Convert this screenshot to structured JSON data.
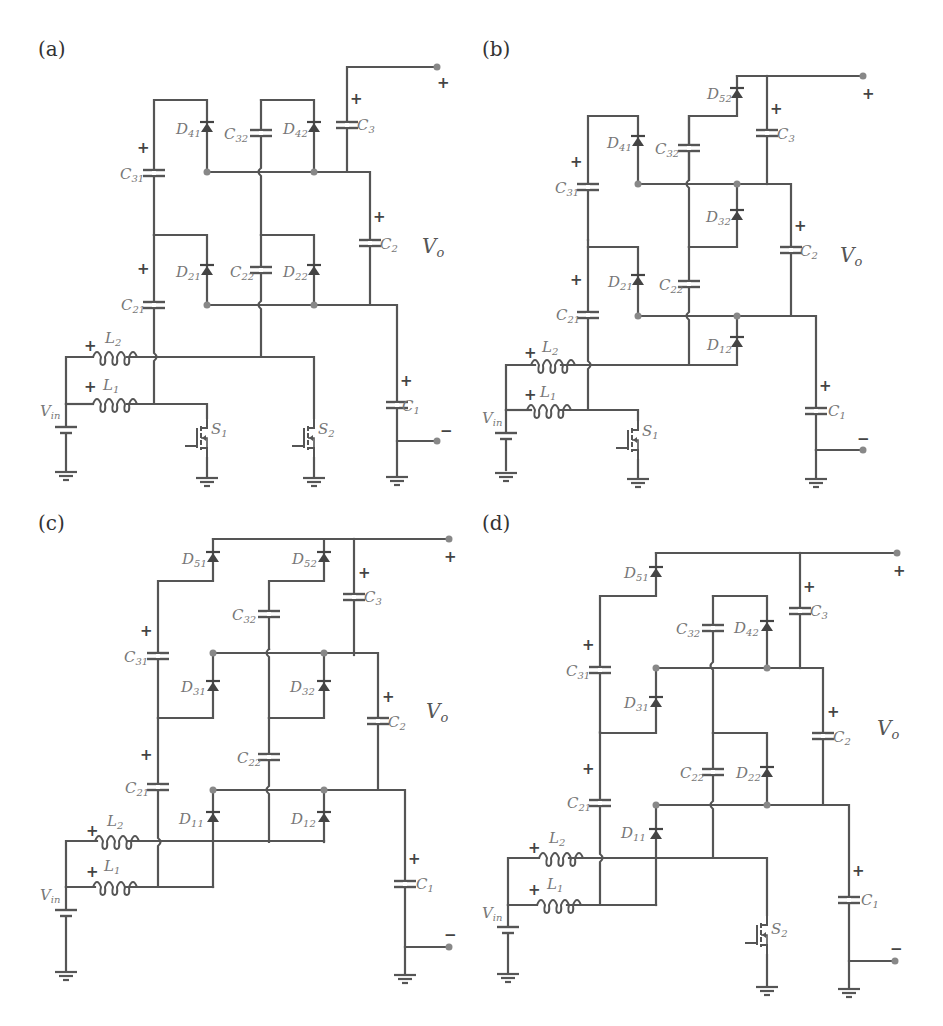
{
  "figure": {
    "panels": [
      {
        "id": "a",
        "label": "(a)",
        "output_label": "V",
        "output_sub": "o",
        "plus_sign": "+",
        "minus_sign": "−",
        "components": {
          "capacitors": [
            "C31",
            "C32",
            "C3",
            "C21",
            "C22",
            "C2",
            "C1"
          ],
          "diodes": [
            "D41",
            "D42",
            "D21",
            "D22"
          ],
          "inductors": [
            "L1",
            "L2"
          ],
          "switches": [
            "S1",
            "S2"
          ],
          "source": "Vin"
        }
      },
      {
        "id": "b",
        "label": "(b)",
        "output_label": "V",
        "output_sub": "o",
        "plus_sign": "+",
        "minus_sign": "−",
        "components": {
          "capacitors": [
            "C31",
            "C32",
            "C3",
            "C21",
            "C22",
            "C2",
            "C1"
          ],
          "diodes": [
            "D52",
            "D41",
            "D32",
            "D21",
            "D12"
          ],
          "inductors": [
            "L1",
            "L2"
          ],
          "switches": [
            "S1"
          ],
          "source": "Vin"
        }
      },
      {
        "id": "c",
        "label": "(c)",
        "output_label": "V",
        "output_sub": "o",
        "plus_sign": "+",
        "minus_sign": "−",
        "components": {
          "capacitors": [
            "C31",
            "C32",
            "C3",
            "C21",
            "C22",
            "C2",
            "C1"
          ],
          "diodes": [
            "D51",
            "D52",
            "D31",
            "D32",
            "D11",
            "D12"
          ],
          "inductors": [
            "L1",
            "L2"
          ],
          "switches": [],
          "source": "Vin"
        }
      },
      {
        "id": "d",
        "label": "(d)",
        "output_label": "V",
        "output_sub": "o",
        "plus_sign": "+",
        "minus_sign": "−",
        "components": {
          "capacitors": [
            "C31",
            "C32",
            "C3",
            "C21",
            "C22",
            "C2",
            "C1"
          ],
          "diodes": [
            "D51",
            "D42",
            "D31",
            "D22",
            "D11"
          ],
          "inductors": [
            "L1",
            "L2"
          ],
          "switches": [
            "S2"
          ],
          "source": "Vin"
        }
      }
    ],
    "labels": {
      "C31": {
        "main": "C",
        "sub": "31"
      },
      "C32": {
        "main": "C",
        "sub": "32"
      },
      "C3": {
        "main": "C",
        "sub": "3"
      },
      "C21": {
        "main": "C",
        "sub": "21"
      },
      "C22": {
        "main": "C",
        "sub": "22"
      },
      "C2": {
        "main": "C",
        "sub": "2"
      },
      "C1": {
        "main": "C",
        "sub": "1"
      },
      "D41": {
        "main": "D",
        "sub": "41"
      },
      "D42": {
        "main": "D",
        "sub": "42"
      },
      "D21": {
        "main": "D",
        "sub": "21"
      },
      "D22": {
        "main": "D",
        "sub": "22"
      },
      "D52": {
        "main": "D",
        "sub": "52"
      },
      "D51": {
        "main": "D",
        "sub": "51"
      },
      "D32": {
        "main": "D",
        "sub": "32"
      },
      "D31": {
        "main": "D",
        "sub": "31"
      },
      "D12": {
        "main": "D",
        "sub": "12"
      },
      "D11": {
        "main": "D",
        "sub": "11"
      },
      "L1": {
        "main": "L",
        "sub": "1"
      },
      "L2": {
        "main": "L",
        "sub": "2"
      },
      "S1": {
        "main": "S",
        "sub": "1"
      },
      "S2": {
        "main": "S",
        "sub": "2"
      },
      "Vin": {
        "main": "V",
        "sub": "in"
      }
    },
    "colors": {
      "wire": "#555555",
      "label": "#777777",
      "node_dot": "#888888",
      "background": "#ffffff"
    }
  }
}
